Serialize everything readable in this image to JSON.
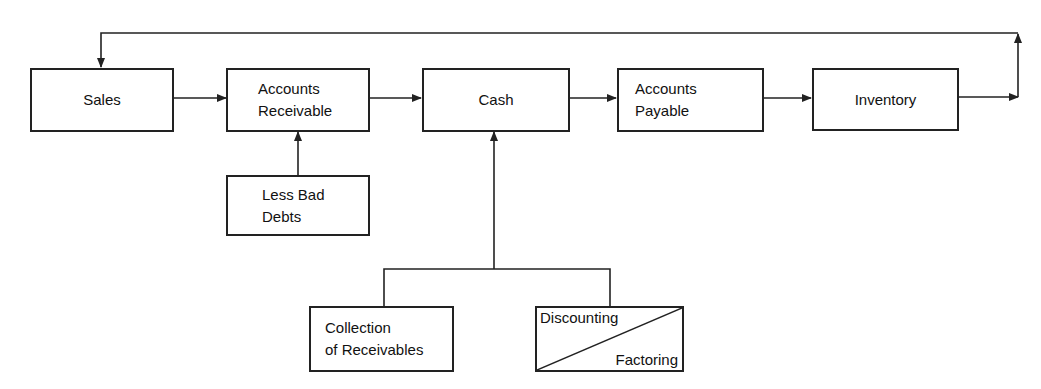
{
  "diagram": {
    "nodes": {
      "sales": "Sales",
      "accounts_receivable": "Accounts\nReceivable",
      "cash": "Cash",
      "accounts_payable": "Accounts\nPayable",
      "inventory": "Inventory",
      "less_bad_debts": "Less Bad\nDebts",
      "collection": "Collection\nof Receivables",
      "discounting": "Discounting",
      "factoring": "Factoring"
    },
    "edges": [
      [
        "Sales",
        "Accounts Receivable"
      ],
      [
        "Accounts Receivable",
        "Cash"
      ],
      [
        "Cash",
        "Accounts Payable"
      ],
      [
        "Accounts Payable",
        "Inventory"
      ],
      [
        "Inventory",
        "Sales"
      ],
      [
        "Less Bad Debts",
        "Accounts Receivable"
      ],
      [
        "Collection of Receivables",
        "Cash"
      ],
      [
        "Discounting / Factoring",
        "Cash"
      ]
    ]
  }
}
